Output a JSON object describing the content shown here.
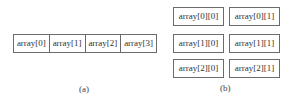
{
  "figure_a": {
    "caption": "(a)",
    "cells": [
      "array[0]",
      "array[1]",
      "array[2]",
      "array[3]"
    ]
  },
  "figure_b": {
    "caption": "(b)",
    "rows": [
      [
        "array[0][0]",
        "array[0][1]"
      ],
      [
        "array[1][0]",
        "array[1][1]"
      ],
      [
        "array[2][0]",
        "array[2][1]"
      ]
    ]
  }
}
